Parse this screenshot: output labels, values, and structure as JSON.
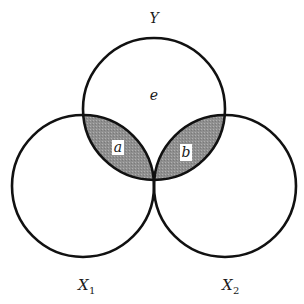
{
  "diagram": {
    "type": "venn-3-circles",
    "circles": [
      {
        "id": "Y",
        "label": "Y",
        "cx": 154,
        "cy": 109,
        "r": 71
      },
      {
        "id": "X1",
        "label": "X",
        "subscript": "1",
        "cx": 83,
        "cy": 186,
        "r": 71
      },
      {
        "id": "X2",
        "label": "X",
        "subscript": "2",
        "cx": 225,
        "cy": 186,
        "r": 71
      }
    ],
    "regions": [
      {
        "id": "e",
        "label": "e",
        "shaded": false
      },
      {
        "id": "a",
        "label": "a",
        "shaded": true
      },
      {
        "id": "b",
        "label": "b",
        "shaded": true
      }
    ],
    "colors": {
      "stroke": "#111111",
      "shade": "#8f8f8f",
      "background": "#ffffff"
    }
  }
}
